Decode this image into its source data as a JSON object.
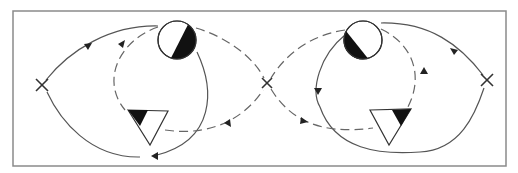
{
  "diagram": {
    "type": "figure-eight flow diagram with two mirrored lobes",
    "colors": {
      "line": "#555555",
      "frame": "#8a8a8a",
      "fill": "#111111",
      "background": "#ffffff"
    },
    "nodes": [
      {
        "id": "left-x",
        "shape": "cross",
        "x": 42,
        "y": 85
      },
      {
        "id": "center-x",
        "shape": "cross",
        "x": 267,
        "y": 83
      },
      {
        "id": "right-x",
        "shape": "cross",
        "x": 487,
        "y": 80
      },
      {
        "id": "left-circle",
        "shape": "half-filled-circle",
        "x": 177,
        "y": 40,
        "filled_side": "right"
      },
      {
        "id": "right-circle",
        "shape": "half-filled-circle",
        "x": 363,
        "y": 40,
        "filled_side": "left"
      },
      {
        "id": "left-triangle",
        "shape": "partly-filled-triangle",
        "x": 150,
        "y": 128,
        "filled_corner": "top-left"
      },
      {
        "id": "right-triangle",
        "shape": "partly-filled-triangle",
        "x": 390,
        "y": 126,
        "filled_corner": "top-right"
      }
    ],
    "paths": [
      {
        "id": "left-outer-solid",
        "style": "solid",
        "arrows": 2
      },
      {
        "id": "left-inner-dashed",
        "style": "dashed",
        "arrows": 2
      },
      {
        "id": "right-outer-solid",
        "style": "solid",
        "arrows": 2
      },
      {
        "id": "right-inner-dashed",
        "style": "dashed",
        "arrows": 2
      }
    ]
  }
}
